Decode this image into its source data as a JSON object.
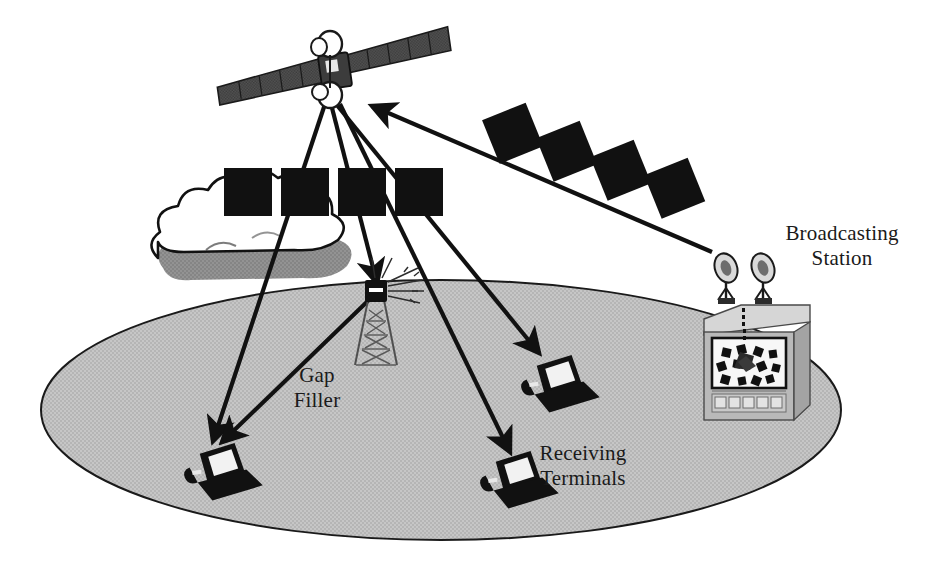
{
  "diagram": {
    "type": "satellite-broadcast-architecture",
    "labels": {
      "broadcasting_station": "Broadcasting\nStation",
      "gap_filler": "Gap\nFiller",
      "receiving_terminals": "Receiving\nTerminals"
    },
    "colors": {
      "background": "#ffffff",
      "ground_ellipse": "#c2c2c2",
      "ground_outline": "#1a1a1a",
      "cloud_fill": "#ffffff",
      "cloud_outline": "#111111",
      "cloud_shadow": "#818181",
      "solid_black": "#111111",
      "station_body": "#b9b9b9",
      "station_top": "#d6d6d6",
      "station_side": "#a3a3a3",
      "screen_white": "#f7f7f7",
      "satellite_panel": "#4a4a4a",
      "text": "#1a1a1a"
    },
    "elements": {
      "satellite": {
        "name": "broadcast-satellite",
        "wings": 2,
        "wing_segments": 5,
        "antenna_dishes": 2
      },
      "signal_blocks_downlink": {
        "name": "downlink-data-blocks",
        "count": 4,
        "orientation": "horizontal-row"
      },
      "signal_blocks_uplink": {
        "name": "uplink-data-blocks",
        "count": 4,
        "orientation": "diagonal-row"
      },
      "cloud": {
        "name": "obstruction-cloud",
        "lobes": 8
      },
      "gap_filler_tower": {
        "name": "gap-filler-tower",
        "lattice_levels": 6
      },
      "broadcasting_station": {
        "name": "broadcasting-station-unit",
        "dish_antennas": 2,
        "screen_blocks": 14,
        "front_panel_buttons": 5
      },
      "receiving_terminals": {
        "name": "receiving-terminal-laptops",
        "count": 3,
        "positions": [
          "lower-left",
          "center-right",
          "bottom-center"
        ]
      },
      "arrows": {
        "uplink": 1,
        "downlink": 5
      }
    }
  }
}
